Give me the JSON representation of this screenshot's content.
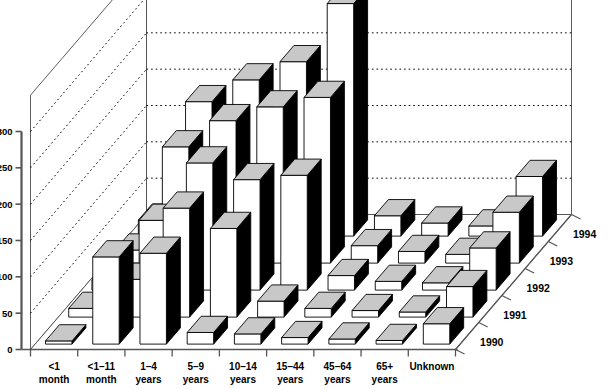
{
  "chart_data": {
    "type": "bar",
    "title": "",
    "subtitle": "",
    "xlabel": "",
    "ylabel": "",
    "zlabel": "",
    "projection": "3d",
    "grid": true,
    "legend_position": "none",
    "ylim": [
      0,
      350
    ],
    "yticks": [
      0,
      50,
      100,
      150,
      200,
      250,
      300
    ],
    "ytick_labels": [
      "0",
      "50",
      "100",
      "150",
      "200",
      "250",
      "300"
    ],
    "categories": [
      "<1\nmonth",
      "<1–11\nmonth",
      "1–4\nyears",
      "5–9\nyears",
      "10–14\nyears",
      "15–44\nyears",
      "45–64\nyears",
      "65+\nyears",
      "Unknown"
    ],
    "category_labels": [
      [
        "<1",
        "month"
      ],
      [
        "<1–11",
        "month"
      ],
      [
        "1–4",
        "years"
      ],
      [
        "5–9",
        "years"
      ],
      [
        "10–14",
        "years"
      ],
      [
        "15–44",
        "years"
      ],
      [
        "45–64",
        "years"
      ],
      [
        "65+",
        "years"
      ],
      [
        "Unknown",
        ""
      ]
    ],
    "z_categories": [
      "1990",
      "1991",
      "1992",
      "1993",
      "1994"
    ],
    "series": [
      {
        "name": "1990",
        "values": [
          4,
          120,
          125,
          16,
          14,
          9,
          7,
          5,
          28
        ]
      },
      {
        "name": "1991",
        "values": [
          12,
          52,
          150,
          122,
          22,
          12,
          9,
          7,
          42
        ]
      },
      {
        "name": "1992",
        "values": [
          14,
          96,
          175,
          152,
          158,
          20,
          12,
          10,
          58
        ]
      },
      {
        "name": "1993",
        "values": [
          18,
          160,
          196,
          215,
          228,
          24,
          16,
          12,
          70
        ]
      },
      {
        "name": "1994",
        "values": [
          22,
          185,
          215,
          240,
          320,
          28,
          18,
          14,
          82
        ]
      }
    ],
    "bar_face_color": "#ffffff",
    "bar_top_color": "#c8c8c8",
    "bar_side_color": "#000000",
    "bar_edge_color": "#000000",
    "grid_color": "#000000",
    "axis_color": "#555555",
    "background_color": "#ffffff"
  }
}
